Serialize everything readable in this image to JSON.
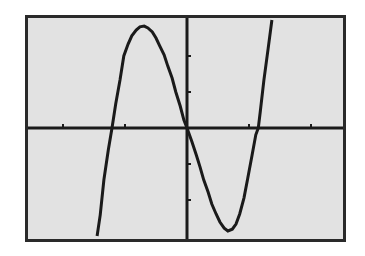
{
  "chart_data": {
    "type": "line",
    "title": "",
    "xlabel": "",
    "ylabel": "",
    "function_guess": "y = 4x^3 - 6x",
    "window": {
      "xmin": -2.6,
      "xmax": 2.56,
      "ymin": -3.19,
      "ymax": 3.14,
      "xscl": 1,
      "yscl": 1
    },
    "grid": false,
    "legend": null,
    "x_ticks": [
      -2,
      -1,
      1,
      2
    ],
    "y_ticks": [
      -2,
      -1,
      1,
      2
    ],
    "key_points": {
      "roots": [
        -1.22,
        0,
        1.22
      ],
      "local_max": [
        -0.69,
        2.8
      ],
      "local_min": [
        0.65,
        -2.89
      ]
    },
    "series": [
      {
        "name": "Y1",
        "points": [
          [
            -1.45,
            -3.0
          ],
          [
            -1.4,
            -2.42
          ],
          [
            -1.34,
            -1.44
          ],
          [
            -1.27,
            -0.61
          ],
          [
            -1.21,
            0.0
          ],
          [
            -1.15,
            0.67
          ],
          [
            -1.08,
            1.33
          ],
          [
            -1.02,
            2.0
          ],
          [
            -0.95,
            2.33
          ],
          [
            -0.89,
            2.56
          ],
          [
            -0.82,
            2.72
          ],
          [
            -0.76,
            2.81
          ],
          [
            -0.69,
            2.83
          ],
          [
            -0.63,
            2.78
          ],
          [
            -0.56,
            2.67
          ],
          [
            -0.5,
            2.5
          ],
          [
            -0.44,
            2.28
          ],
          [
            -0.37,
            2.03
          ],
          [
            -0.31,
            1.72
          ],
          [
            -0.24,
            1.39
          ],
          [
            -0.18,
            1.0
          ],
          [
            -0.11,
            0.61
          ],
          [
            -0.05,
            0.22
          ],
          [
            0.0,
            0.0
          ],
          [
            0.08,
            -0.39
          ],
          [
            0.15,
            -0.75
          ],
          [
            0.21,
            -1.08
          ],
          [
            0.27,
            -1.44
          ],
          [
            0.34,
            -1.78
          ],
          [
            0.4,
            -2.11
          ],
          [
            0.47,
            -2.39
          ],
          [
            0.53,
            -2.61
          ],
          [
            0.6,
            -2.78
          ],
          [
            0.66,
            -2.86
          ],
          [
            0.73,
            -2.81
          ],
          [
            0.79,
            -2.67
          ],
          [
            0.85,
            -2.39
          ],
          [
            0.92,
            -1.94
          ],
          [
            0.98,
            -1.39
          ],
          [
            1.05,
            -0.75
          ],
          [
            1.11,
            -0.19
          ],
          [
            1.15,
            0.0
          ],
          [
            1.18,
            0.44
          ],
          [
            1.24,
            1.33
          ],
          [
            1.31,
            2.22
          ],
          [
            1.37,
            3.0
          ]
        ]
      }
    ],
    "colors": {
      "screen_bg": "#e2e2e2",
      "ink": "#1a1a1a",
      "frame": "#2a2a2a",
      "page_bg": "#ffffff"
    }
  }
}
